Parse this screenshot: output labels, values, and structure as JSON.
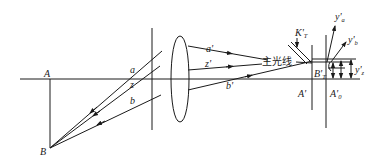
{
  "diagram": {
    "type": "optical-ray-diagram",
    "labels": {
      "object_axis_point": "A",
      "object_point": "B",
      "ray_a": "a",
      "ray_z": "z",
      "ray_b": "b",
      "ray_a_prime": "a'",
      "ray_z_prime": "z'",
      "ray_b_prime": "b'",
      "chief_ray": "主光线",
      "image_axis_point": "A'",
      "image_axis_point_0": "A'",
      "image_axis_point_0_sub": "0",
      "image_point_t": "B'",
      "image_point_t_sub": "T",
      "focal_surface_k": "K'",
      "focal_surface_k_sub": "T",
      "height_a": "y'",
      "height_a_sub": "a",
      "height_b": "y'",
      "height_b_sub": "b",
      "height_z": "y'",
      "height_z_sub": "z"
    },
    "colors": {
      "line": "#1a1a1a",
      "background": "#ffffff"
    }
  }
}
